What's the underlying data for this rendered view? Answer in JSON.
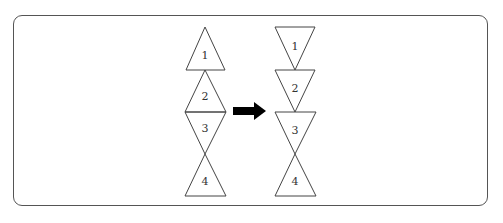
{
  "diagram": {
    "before": {
      "triangles": [
        {
          "label": "1",
          "orientation": "up"
        },
        {
          "label": "2",
          "orientation": "up"
        },
        {
          "label": "3",
          "orientation": "down"
        },
        {
          "label": "4",
          "orientation": "up"
        }
      ]
    },
    "arrow": {
      "direction": "right",
      "color": "#000000"
    },
    "after": {
      "triangles": [
        {
          "label": "1",
          "orientation": "down"
        },
        {
          "label": "2",
          "orientation": "down"
        },
        {
          "label": "3",
          "orientation": "down"
        },
        {
          "label": "4",
          "orientation": "up"
        }
      ]
    },
    "stroke_color": "#444444",
    "frame_color": "#555555"
  }
}
